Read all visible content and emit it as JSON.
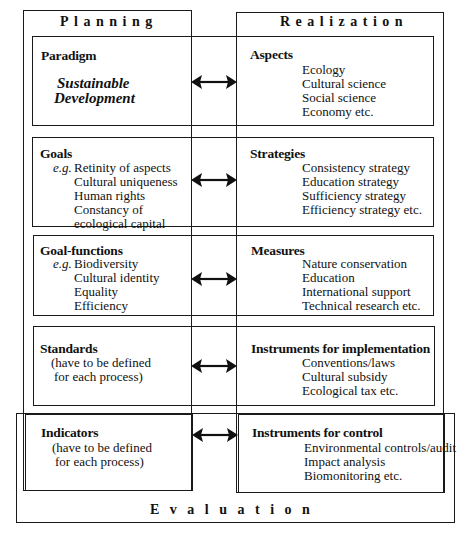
{
  "columns": {
    "planning": "Planning",
    "realization": "Realization",
    "evaluation": "Evaluation"
  },
  "rows": [
    {
      "left": {
        "heading": "Paradigm",
        "emphasis": [
          "Sustainable",
          "Development"
        ]
      },
      "right": {
        "heading": "Aspects",
        "items": [
          "Ecology",
          "Cultural science",
          "Social science",
          "Economy etc."
        ]
      }
    },
    {
      "left": {
        "heading": "Goals",
        "prefix": "e.g.",
        "items": [
          "Retinity of aspects",
          "Cultural uniqueness",
          "Human rights",
          "Constancy of",
          "ecological capital"
        ]
      },
      "right": {
        "heading": "Strategies",
        "items": [
          "Consistency strategy",
          "Education strategy",
          "Sufficiency strategy",
          "Efficiency strategy etc."
        ]
      }
    },
    {
      "left": {
        "heading": "Goal-functions",
        "prefix": "e.g.",
        "items": [
          "Biodiversity",
          "Cultural identity",
          "Equality",
          "Efficiency"
        ]
      },
      "right": {
        "heading": "Measures",
        "items": [
          "Nature conservation",
          "Education",
          "International support",
          "Technical research  etc."
        ]
      }
    },
    {
      "left": {
        "heading": "Standards",
        "items": [
          "(have to be defined",
          "for each process)"
        ]
      },
      "right": {
        "heading": "Instruments for implementation",
        "items": [
          "Conventions/laws",
          "Cultural subsidy",
          "Ecological tax  etc."
        ]
      }
    },
    {
      "left": {
        "heading": "Indicators",
        "items": [
          "(have to be defined",
          "for each process)"
        ]
      },
      "right": {
        "heading": "Instruments for control",
        "items": [
          "Environmental controls/audit",
          "Impact analysis",
          "Biomonitoring etc."
        ]
      }
    }
  ],
  "connector": {
    "type": "double-headed-arrow",
    "count": 5
  }
}
